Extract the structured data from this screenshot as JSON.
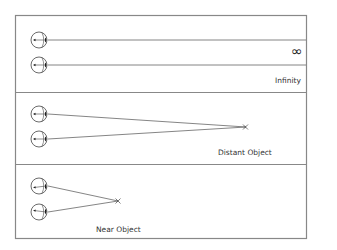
{
  "diagram": {
    "colors": {
      "frame": "#888888",
      "line": "#555555",
      "eye": "#444444",
      "pupil": "#111111",
      "text": "#333333"
    },
    "panels": [
      {
        "id": "infinity",
        "label": "Infinity",
        "symbol": "∞",
        "description": "Parallel lines of sight"
      },
      {
        "id": "distant",
        "label": "Distant Object",
        "description": "Lines of sight converge at a far point (x)"
      },
      {
        "id": "near",
        "label": "Near Object",
        "description": "Lines of sight converge at a near point (x)"
      }
    ]
  }
}
